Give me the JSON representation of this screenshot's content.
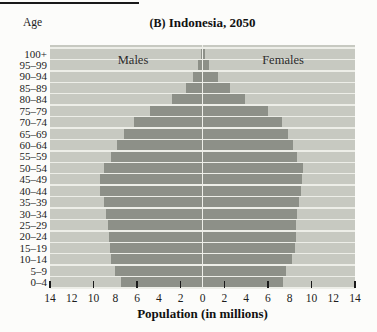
{
  "figure": {
    "title_bold": "(B)",
    "title_rest": " Indonesia, 2050"
  },
  "chart_data": {
    "type": "bar",
    "subtype": "population_pyramid",
    "title": "(B) Indonesia, 2050",
    "xlabel": "Population (in millions)",
    "ylabel": "Age",
    "units": "millions of people",
    "x_range_each_side": 14,
    "x_tick_labels": [
      "14",
      "12",
      "10",
      "8",
      "6",
      "4",
      "2",
      "0",
      "2",
      "4",
      "6",
      "8",
      "10",
      "12",
      "14"
    ],
    "x_tick_marks_at": [
      -14,
      -10,
      -6,
      -2,
      2,
      6,
      10,
      14
    ],
    "grid": "horizontal-row-separators",
    "legend_position": "inside-top",
    "age_groups": [
      "100+",
      "95–99",
      "90–94",
      "85–89",
      "80–84",
      "75–79",
      "70–74",
      "65–69",
      "60–64",
      "55–59",
      "50–54",
      "45–49",
      "40–44",
      "35–39",
      "30–34",
      "25–29",
      "20–24",
      "15–19",
      "10–14",
      "5–9",
      "0–4"
    ],
    "series": [
      {
        "name": "Males",
        "side": "left",
        "values": [
          0.15,
          0.4,
          0.9,
          1.5,
          2.8,
          4.8,
          6.3,
          7.2,
          7.8,
          8.4,
          9.0,
          9.4,
          9.4,
          9.0,
          8.85,
          8.7,
          8.6,
          8.5,
          8.35,
          8.0,
          7.5
        ]
      },
      {
        "name": "Females",
        "side": "right",
        "values": [
          0.25,
          0.6,
          1.4,
          2.5,
          3.9,
          6.0,
          7.3,
          7.85,
          8.3,
          8.65,
          9.2,
          9.1,
          9.0,
          8.85,
          8.7,
          8.6,
          8.55,
          8.5,
          8.2,
          7.7,
          7.4
        ]
      }
    ],
    "colors": {
      "bar": "#8d9088",
      "plot_background": "#c7c9c1",
      "grid_lines": "#edeee8",
      "tick_marks": "#1a1a1a"
    }
  }
}
